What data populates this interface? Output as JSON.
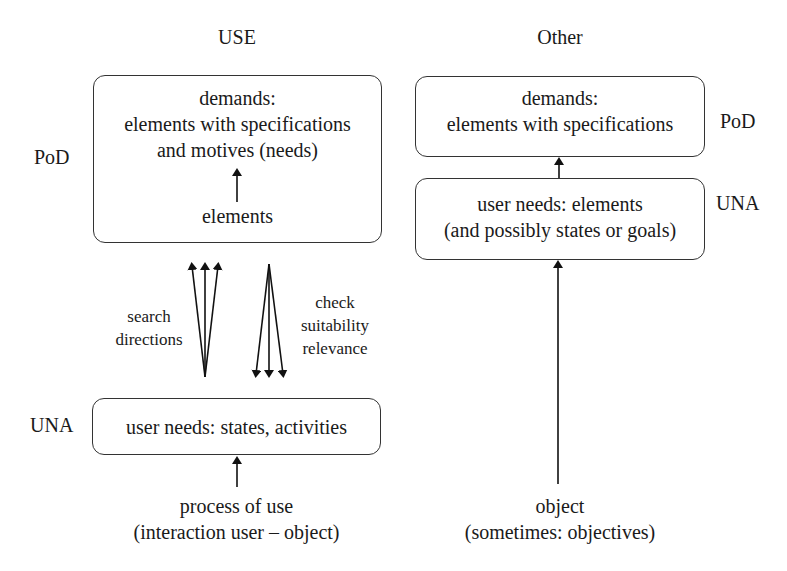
{
  "left_column": {
    "heading": "USE",
    "pod_label": "PoD",
    "una_label": "UNA",
    "top_box": {
      "line1": "demands:",
      "line2": "elements with specifications",
      "line3": "and motives (needs)",
      "inner_label": "elements"
    },
    "search_label": {
      "line1": "search",
      "line2": "directions"
    },
    "check_label": {
      "line1": "check",
      "line2": "suitability",
      "line3": "relevance"
    },
    "bottom_box": {
      "line1": "user needs: states, activities"
    },
    "source": {
      "line1": "process of use",
      "line2": "(interaction user – object)"
    }
  },
  "right_column": {
    "heading": "Other",
    "pod_label": "PoD",
    "una_label": "UNA",
    "top_box": {
      "line1": "demands:",
      "line2": "elements with specifications"
    },
    "middle_box": {
      "line1": "user needs: elements",
      "line2": "(and possibly states or goals)"
    },
    "source": {
      "line1": "object",
      "line2": "(sometimes: objectives)"
    }
  }
}
